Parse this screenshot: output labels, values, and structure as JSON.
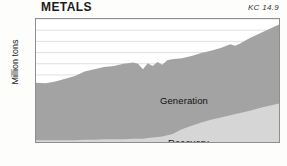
{
  "header": {
    "title": "METALS",
    "code": "KC 14.9"
  },
  "axes": {
    "ylabel": "Million tons",
    "yticks": [
      "0",
      "2",
      "4",
      "6",
      "8",
      "10",
      "12",
      "14",
      "16",
      "18",
      "20",
      "22"
    ],
    "xticks": [
      "1960",
      "1970",
      "1980",
      "1990",
      "2000",
      "2010"
    ]
  },
  "series_labels": {
    "generation": "Generation",
    "recovery": "Recovery"
  },
  "colors": {
    "generation_fill": "#a3a3a3",
    "recovery_fill": "#d6d6d6",
    "frame": "#8e8e8e",
    "gridline": "#d9d9d9",
    "text": "#1a1a1a",
    "background": "#fdfdfc"
  },
  "chart_data": {
    "type": "area",
    "title": "METALS",
    "subtitle": "KC 14.9",
    "xlabel": "",
    "ylabel": "Million tons",
    "xlim": [
      1960,
      2010
    ],
    "ylim": [
      0,
      22
    ],
    "grid": true,
    "stacked": true,
    "legend_position": "inline-annotation",
    "x": [
      1960,
      1962,
      1964,
      1966,
      1968,
      1970,
      1972,
      1974,
      1976,
      1978,
      1980,
      1981,
      1982,
      1983,
      1984,
      1985,
      1986,
      1987,
      1988,
      1990,
      1992,
      1994,
      1996,
      1998,
      2000,
      2001,
      2002,
      2004,
      2006,
      2008,
      2010
    ],
    "series": [
      {
        "name": "Generation",
        "note": "Total metals generation, upper boundary of stacked area (million tons)",
        "values": [
          10.6,
          10.5,
          10.8,
          11.3,
          11.8,
          12.6,
          13.0,
          13.4,
          13.6,
          14.0,
          14.2,
          14.0,
          13.0,
          14.1,
          13.6,
          14.3,
          13.8,
          14.6,
          14.8,
          15.0,
          15.4,
          15.9,
          16.3,
          16.8,
          17.5,
          17.2,
          17.6,
          18.6,
          19.4,
          20.2,
          21.0
        ]
      },
      {
        "name": "Recovery",
        "note": "Metals recovered for recycling, lower band of stacked area (million tons)",
        "values": [
          0.3,
          0.3,
          0.3,
          0.3,
          0.3,
          0.4,
          0.4,
          0.5,
          0.5,
          0.5,
          0.6,
          0.6,
          0.6,
          0.7,
          0.8,
          0.9,
          1.0,
          1.2,
          1.4,
          2.3,
          2.9,
          3.5,
          4.0,
          4.4,
          4.8,
          5.0,
          5.2,
          5.6,
          6.1,
          6.5,
          6.9
        ]
      }
    ]
  }
}
